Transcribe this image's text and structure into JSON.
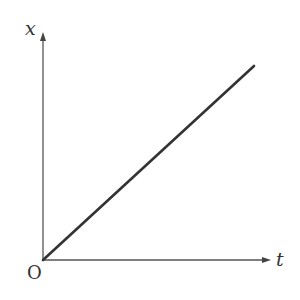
{
  "diagram": {
    "type": "position-time graph",
    "y_axis_label": "x",
    "x_axis_label": "t",
    "origin_label": "O",
    "line": {
      "from": [
        43,
        260
      ],
      "to": [
        254,
        66
      ],
      "description": "straight line through origin"
    },
    "colors": {
      "axis": "#555555",
      "line": "#333333"
    }
  }
}
